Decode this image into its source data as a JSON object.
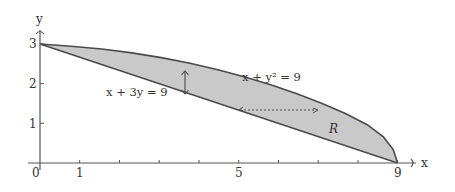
{
  "figure": {
    "type": "region-between-curves",
    "axes": {
      "x_label": "x",
      "y_label": "y",
      "origin_label": "0",
      "x_ticks": [
        1,
        2,
        3,
        4,
        5,
        6,
        7,
        8,
        9
      ],
      "x_tick_labels": [
        {
          "value": 1,
          "text": "1"
        },
        {
          "value": 5,
          "text": "5"
        },
        {
          "value": 9,
          "text": "9"
        }
      ],
      "y_ticks": [
        1,
        2,
        3
      ],
      "y_tick_labels": [
        {
          "value": 1,
          "text": "1"
        },
        {
          "value": 2,
          "text": "2"
        },
        {
          "value": 3,
          "text": "3"
        }
      ]
    },
    "curves": [
      {
        "name": "line",
        "equation": "x + 3y = 9",
        "label": "x + 3y = 9"
      },
      {
        "name": "parabola",
        "equation": "x + y² = 9",
        "label": "x + y² = 9"
      }
    ],
    "region_label": "R",
    "annotations": {
      "vertical_strip_arrow": "double-headed vertical arrow between curves near x≈3.6",
      "horizontal_strip_arrow": "dotted horizontal arrow between curves at y≈1.35"
    },
    "colors": {
      "fill": "#c9c9c9",
      "stroke": "#4a4a4a",
      "axis": "#555555"
    }
  }
}
